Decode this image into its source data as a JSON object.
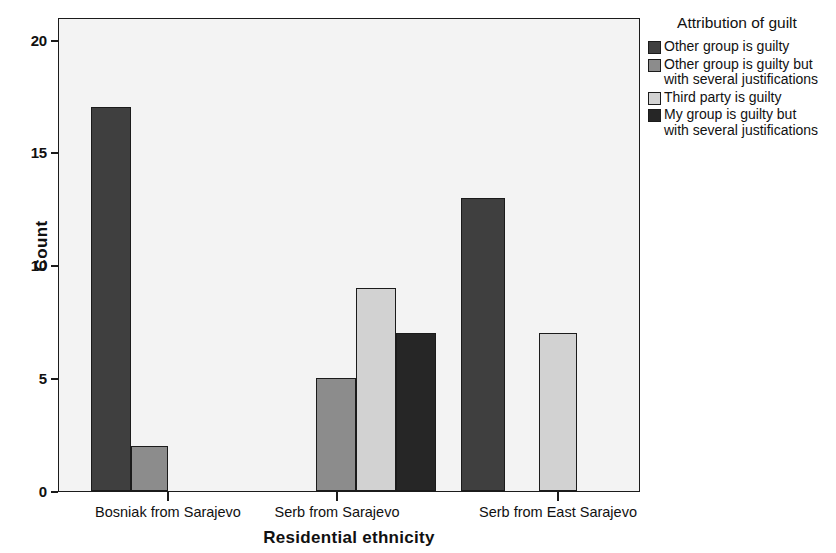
{
  "chart_data": {
    "type": "bar",
    "title": "",
    "xlabel": "Residential ethnicity",
    "ylabel": "Count",
    "ylim": [
      0,
      21
    ],
    "yticks": [
      0,
      5,
      10,
      15,
      20
    ],
    "ytick_labels": [
      "0",
      "5",
      "10",
      "15",
      "20"
    ],
    "grid": false,
    "legend_position": "right",
    "legend_title": "Attribution of guilt",
    "categories": [
      "Bosniak from Sarajevo",
      "Serb from Sarajevo",
      "Serb from East Sarajevo"
    ],
    "series": [
      {
        "name": "Other group is guilty",
        "color": "#3f3f3f",
        "values": [
          17,
          0,
          13
        ]
      },
      {
        "name": "Other group is guilty but\nwith several justifications",
        "color": "#8c8c8c",
        "values": [
          2,
          5,
          0
        ]
      },
      {
        "name": "Third party is guilty",
        "color": "#d2d2d2",
        "values": [
          0,
          9,
          7
        ]
      },
      {
        "name": "My group is guilty but\nwith several justifications",
        "color": "#262626",
        "values": [
          0,
          7,
          0
        ]
      }
    ],
    "bars": [
      {
        "category": "Bosniak from Sarajevo",
        "series": "Other group is guilty",
        "value": 17,
        "color": "#3f3f3f",
        "x": 32,
        "width": 40
      },
      {
        "category": "Bosniak from Sarajevo",
        "series": "Other group is guilty but\nwith several justifications",
        "value": 2,
        "color": "#8c8c8c",
        "x": 72,
        "width": 37
      },
      {
        "category": "Serb from Sarajevo",
        "series": "Other group is guilty but\nwith several justifications",
        "value": 5,
        "color": "#8c8c8c",
        "x": 257,
        "width": 40
      },
      {
        "category": "Serb from Sarajevo",
        "series": "Third party is guilty",
        "value": 9,
        "color": "#d2d2d2",
        "x": 297,
        "width": 40
      },
      {
        "category": "Serb from Sarajevo",
        "series": "My group is guilty but\nwith several justifications",
        "value": 7,
        "color": "#262626",
        "x": 337,
        "width": 40
      },
      {
        "category": "Serb from East Sarajevo",
        "series": "Other group is guilty",
        "value": 13,
        "color": "#3f3f3f",
        "x": 402,
        "width": 44
      },
      {
        "category": "Serb from East Sarajevo",
        "series": "Third party is guilty",
        "value": 7,
        "color": "#d2d2d2",
        "x": 480,
        "width": 38
      }
    ],
    "category_tick_positions": [
      109,
      278,
      499
    ]
  },
  "axes": {
    "y_title": "Count",
    "x_title": "Residential ethnicity",
    "y_tick_labels": [
      "20",
      "15",
      "10",
      "5",
      "0"
    ]
  },
  "legend": {
    "title": "Attribution of guilt",
    "entries": [
      {
        "label": "Other group is guilty",
        "color": "#3f3f3f"
      },
      {
        "label": "Other group is guilty but\nwith several justifications",
        "color": "#8c8c8c"
      },
      {
        "label": "Third party is guilty",
        "color": "#d2d2d2"
      },
      {
        "label": "My group is guilty but\nwith several justifications",
        "color": "#262626"
      }
    ]
  }
}
